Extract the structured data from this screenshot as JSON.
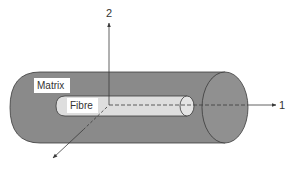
{
  "diagram": {
    "labels": {
      "matrix": "Matrix",
      "fibre": "Fibre",
      "axis1": "1",
      "axis2": "2"
    },
    "colors": {
      "matrix_fill": "#8a8a8a",
      "matrix_end_fill": "#909090",
      "fibre_fill": "#dedede",
      "label_bg": "#ffffff",
      "line": "#3a3a3a"
    }
  }
}
